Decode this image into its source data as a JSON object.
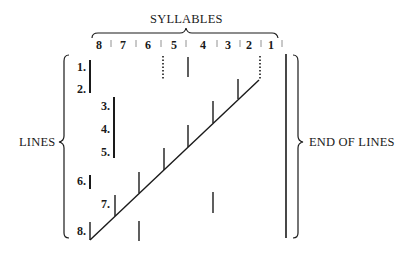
{
  "title": "SYLLABLES",
  "left_label": "LINES",
  "right_label": "END OF LINES",
  "syllables": [
    {
      "label": "8",
      "x": 100
    },
    {
      "label": "7",
      "x": 124
    },
    {
      "label": "6",
      "x": 149
    },
    {
      "label": "5",
      "x": 175
    },
    {
      "label": "4",
      "x": 204
    },
    {
      "label": "3",
      "x": 229
    },
    {
      "label": "2",
      "x": 250
    },
    {
      "label": "1",
      "x": 272
    }
  ],
  "lines": [
    {
      "label": "1.",
      "x": 72,
      "y": 62
    },
    {
      "label": "2.",
      "x": 72,
      "y": 83
    },
    {
      "label": "3.",
      "x": 96,
      "y": 101
    },
    {
      "label": "4.",
      "x": 96,
      "y": 124
    },
    {
      "label": "5.",
      "x": 96,
      "y": 146
    },
    {
      "label": "6.",
      "x": 72,
      "y": 175
    },
    {
      "label": "7.",
      "x": 96,
      "y": 199
    },
    {
      "label": "8.",
      "x": 72,
      "y": 225
    }
  ],
  "colors": {
    "ink": "#1a1a1a",
    "background": "#ffffff"
  }
}
